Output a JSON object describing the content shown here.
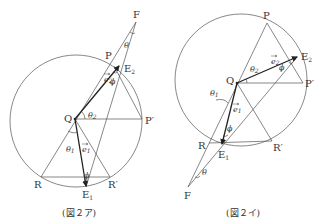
{
  "figures": [
    {
      "caption": "(図２ア)",
      "points": {
        "F": "F",
        "P": "P",
        "E2": "E",
        "E2_sub": "2",
        "Q": "Q",
        "P_prime": "P′",
        "R": "R",
        "R_prime": "R′",
        "E1": "E",
        "E1_sub": "1"
      },
      "angles": {
        "theta": "θ",
        "theta1": "θ",
        "theta1_sub": "1",
        "theta2": "θ",
        "theta2_sub": "2",
        "phi_top": "ϕ",
        "phi_bottom": "ϕ"
      },
      "vectors": {
        "e1": "e",
        "e1_sub": "1",
        "e2": "e",
        "e2_sub": "2"
      }
    },
    {
      "caption": "(図２イ)",
      "points": {
        "F": "F",
        "P": "P",
        "E2": "E",
        "E2_sub": "2",
        "Q": "Q",
        "P_prime": "P′",
        "R": "R",
        "R_prime": "R′",
        "E1": "E",
        "E1_sub": "1"
      },
      "angles": {
        "theta": "θ",
        "theta1": "θ",
        "theta1_sub": "1",
        "theta2": "θ",
        "theta2_sub": "2",
        "phi_top": "ϕ",
        "phi_bottom": "ϕ"
      },
      "vectors": {
        "e1": "e",
        "e1_sub": "1",
        "e2": "e",
        "e2_sub": "2"
      }
    }
  ]
}
